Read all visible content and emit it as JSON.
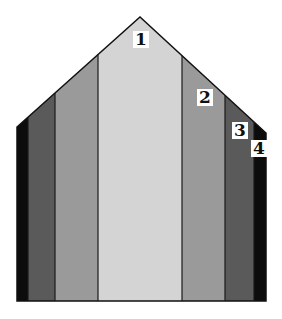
{
  "diagram": {
    "stripes": [
      {
        "name": "outer-left",
        "color": "#0c0c0c"
      },
      {
        "name": "zone-3-left",
        "color": "#5a5a5a"
      },
      {
        "name": "zone-2-left",
        "color": "#9a9a9a"
      },
      {
        "name": "zone-1-center",
        "color": "#d4d4d4"
      },
      {
        "name": "zone-2-right",
        "color": "#9a9a9a"
      },
      {
        "name": "zone-3-right",
        "color": "#5a5a5a"
      },
      {
        "name": "outer-right",
        "color": "#0c0c0c"
      }
    ],
    "labels": [
      "1",
      "2",
      "3",
      "4"
    ]
  }
}
